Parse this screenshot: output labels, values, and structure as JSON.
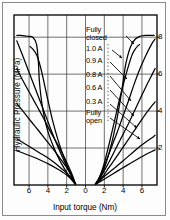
{
  "chart_data": {
    "type": "line",
    "title": "",
    "xlabel": "Input torque (Nm)",
    "ylabel": "Hydraulic Pressure (MPa)",
    "xlim": [
      -7.6,
      7.6
    ],
    "ylim": [
      0,
      9.2
    ],
    "xticks": [
      -6,
      -4,
      -2,
      0,
      2,
      4,
      6
    ],
    "xticklabels": [
      "6",
      "4",
      "2",
      "0",
      "2",
      "4",
      "6"
    ],
    "yticks": [
      2,
      4,
      6,
      8
    ],
    "yticklabels": [
      "2",
      "4",
      "6",
      "8"
    ],
    "grid": true,
    "legend_position": "inside-center-annotations",
    "annotations": [
      {
        "label": "Fully closed",
        "x": 0.2,
        "y": 8.0
      },
      {
        "label": "1.0 A",
        "x": 0.2,
        "y": 6.9
      },
      {
        "label": "0.9 A",
        "x": 0.2,
        "y": 6.1
      },
      {
        "label": "0.8 A",
        "x": 0.2,
        "y": 5.2
      },
      {
        "label": "0.6 A",
        "x": 0.2,
        "y": 4.4
      },
      {
        "label": "0.3 A",
        "x": 0.2,
        "y": 3.5
      },
      {
        "label": "Fully open",
        "x": 0.2,
        "y": 2.7
      }
    ],
    "series": [
      {
        "name": "Fully closed",
        "x": [
          -7.3,
          -6.9,
          -6.2,
          -5.6,
          -5.2,
          -5.0,
          -4.9,
          -4.6,
          -4.0,
          -3.0,
          -2.2,
          -1.7,
          -1.4,
          -1.2,
          -1.1
        ],
        "values": [
          8.1,
          8.1,
          8.05,
          8.0,
          7.6,
          6.6,
          5.6,
          4.3,
          2.9,
          1.6,
          0.85,
          0.45,
          0.25,
          0.12,
          0.05
        ]
      },
      {
        "name": "Fully closed-return",
        "x": [
          1.1,
          1.3,
          1.6,
          2.0,
          2.6,
          3.2,
          3.7,
          4.0,
          4.3,
          4.8,
          5.3,
          5.8,
          6.4,
          7.0,
          7.3
        ],
        "values": [
          0.05,
          0.15,
          0.4,
          0.9,
          1.9,
          3.2,
          4.6,
          5.6,
          6.6,
          7.5,
          7.9,
          8.05,
          8.1,
          8.1,
          8.1
        ]
      },
      {
        "name": "1.0 A",
        "x": [
          -5.9,
          -5.6,
          -5.2,
          -4.9,
          -4.6,
          -4.3,
          -4.0,
          -3.5,
          -2.9,
          -2.3,
          -1.8,
          -1.4,
          -1.2,
          -1.05
        ],
        "values": [
          7.5,
          7.35,
          7.05,
          6.6,
          6.0,
          5.3,
          4.6,
          3.5,
          2.4,
          1.5,
          0.85,
          0.42,
          0.2,
          0.05
        ]
      },
      {
        "name": "1.0 A-return",
        "x": [
          1.05,
          1.25,
          1.55,
          1.95,
          2.5,
          3.1,
          3.6,
          4.1,
          4.6,
          5.0,
          5.35,
          5.6,
          5.75
        ],
        "values": [
          0.05,
          0.2,
          0.5,
          1.1,
          2.2,
          3.5,
          4.6,
          5.6,
          6.5,
          7.1,
          7.4,
          7.55,
          7.6
        ]
      },
      {
        "name": "0.9 A",
        "x": [
          -7.3,
          -6.6,
          -6.0,
          -5.4,
          -4.8,
          -4.2,
          -3.6,
          -3.0,
          -2.4,
          -1.9,
          -1.5,
          -1.2,
          -1.05
        ],
        "values": [
          7.8,
          6.9,
          6.1,
          5.3,
          4.5,
          3.7,
          2.9,
          2.15,
          1.45,
          0.9,
          0.5,
          0.2,
          0.05
        ]
      },
      {
        "name": "0.9 A-return",
        "x": [
          1.05,
          1.3,
          1.7,
          2.2,
          2.8,
          3.4,
          4.0,
          4.6,
          5.2,
          5.8,
          6.4,
          7.0,
          7.4
        ],
        "values": [
          0.05,
          0.25,
          0.65,
          1.3,
          2.1,
          2.9,
          3.75,
          4.6,
          5.5,
          6.3,
          7.0,
          7.6,
          7.9
        ]
      },
      {
        "name": "0.8 A",
        "x": [
          -7.3,
          -6.6,
          -5.9,
          -5.2,
          -4.5,
          -3.9,
          -3.3,
          -2.7,
          -2.2,
          -1.8,
          -1.45,
          -1.2,
          -1.05
        ],
        "values": [
          6.3,
          5.6,
          4.95,
          4.3,
          3.65,
          3.05,
          2.5,
          1.95,
          1.45,
          1.0,
          0.6,
          0.25,
          0.05
        ]
      },
      {
        "name": "0.8 A-return",
        "x": [
          1.05,
          1.35,
          1.8,
          2.4,
          3.0,
          3.7,
          4.4,
          5.1,
          5.8,
          6.5,
          7.1,
          7.4
        ],
        "values": [
          0.05,
          0.25,
          0.6,
          1.15,
          1.75,
          2.45,
          3.15,
          3.9,
          4.65,
          5.4,
          6.0,
          6.3
        ]
      },
      {
        "name": "0.6 A",
        "x": [
          -7.3,
          -6.5,
          -5.8,
          -5.0,
          -4.3,
          -3.6,
          -3.0,
          -2.5,
          -2.0,
          -1.6,
          -1.3,
          -1.1
        ],
        "values": [
          4.4,
          3.9,
          3.45,
          2.95,
          2.5,
          2.05,
          1.65,
          1.3,
          0.95,
          0.6,
          0.3,
          0.05
        ]
      },
      {
        "name": "0.6 A-return",
        "x": [
          1.1,
          1.4,
          1.9,
          2.5,
          3.2,
          4.0,
          4.8,
          5.6,
          6.4,
          7.0,
          7.4
        ],
        "values": [
          0.05,
          0.2,
          0.5,
          0.95,
          1.45,
          2.05,
          2.65,
          3.25,
          3.85,
          4.25,
          4.5
        ]
      },
      {
        "name": "0.3 A",
        "x": [
          -7.3,
          -6.5,
          -5.7,
          -4.9,
          -4.1,
          -3.4,
          -2.8,
          -2.3,
          -1.8,
          -1.4,
          -1.15,
          -1.05
        ],
        "values": [
          2.5,
          2.25,
          2.0,
          1.75,
          1.5,
          1.25,
          1.0,
          0.78,
          0.55,
          0.32,
          0.12,
          0.05
        ]
      },
      {
        "name": "0.3 A-return",
        "x": [
          1.05,
          1.4,
          1.9,
          2.6,
          3.4,
          4.2,
          5.0,
          5.8,
          6.6,
          7.2,
          7.4
        ],
        "values": [
          0.05,
          0.18,
          0.42,
          0.72,
          1.05,
          1.4,
          1.75,
          2.1,
          2.4,
          2.6,
          2.7
        ]
      },
      {
        "name": "Fully open",
        "x": [
          -7.3,
          -6.4,
          -5.5,
          -4.6,
          -3.8,
          -3.1,
          -2.5,
          -2.0,
          -1.6,
          -1.3,
          -1.1
        ],
        "values": [
          1.85,
          1.68,
          1.5,
          1.3,
          1.1,
          0.9,
          0.72,
          0.54,
          0.36,
          0.18,
          0.05
        ]
      },
      {
        "name": "Fully open-return",
        "x": [
          1.1,
          1.5,
          2.1,
          2.9,
          3.8,
          4.7,
          5.6,
          6.4,
          7.0,
          7.4
        ],
        "values": [
          0.05,
          0.16,
          0.35,
          0.6,
          0.88,
          1.15,
          1.42,
          1.65,
          1.8,
          1.9
        ]
      }
    ]
  },
  "axes": {
    "x_title": "Input torque (Nm)",
    "y_title": "Hydraulic Pressure (MPa)"
  }
}
